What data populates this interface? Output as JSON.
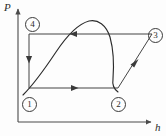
{
  "figure": {
    "kind": "pressure-enthalpy-cycle-diagram",
    "axes": {
      "y_label": "P",
      "x_label": "h",
      "y_axis_x": 18,
      "y_axis_top": 8,
      "y_axis_bottom": 122,
      "x_axis_y": 122,
      "x_axis_left": 18,
      "x_axis_right": 152
    },
    "state_points": [
      {
        "id": "1",
        "label": "①",
        "x": 29,
        "y": 88,
        "label_x": 22,
        "label_y": 97
      },
      {
        "id": "2",
        "label": "②",
        "x": 118,
        "y": 88,
        "label_x": 111,
        "label_y": 97
      },
      {
        "id": "3",
        "label": "③",
        "x": 152,
        "y": 34,
        "label_x": 148,
        "label_y": 28
      },
      {
        "id": "4",
        "label": "④",
        "x": 29,
        "y": 34,
        "label_x": 25,
        "label_y": 17
      }
    ],
    "processes": [
      {
        "from": "1",
        "to": "2",
        "kind": "horizontal",
        "arrow": "right",
        "arrow_at": 0.52
      },
      {
        "from": "2",
        "to": "3",
        "kind": "diagonal",
        "arrow": "up-right",
        "arrow_at": 0.55
      },
      {
        "from": "3",
        "to": "4",
        "kind": "horizontal",
        "arrow": "left",
        "arrow_at": 0.62
      },
      {
        "from": "4",
        "to": "1",
        "kind": "vertical",
        "arrow": "down",
        "arrow_at": 0.53
      }
    ],
    "saturation_dome": {
      "description": "two-phase saturation dome curve with critical point near top",
      "path": "M 23 95 C 33 85, 44 70, 56 52 C 66 37, 78 24, 89 21 C 98 19, 106 25, 110 37 C 113 48, 114 66, 113 79 C 112 85, 114 89, 118 92"
    },
    "colors": {
      "line": "#3a3a3a",
      "curve": "#2b2b2b",
      "axis": "#4a4a4a",
      "background": "#fdfdfd",
      "text": "#2b2b2b"
    }
  }
}
